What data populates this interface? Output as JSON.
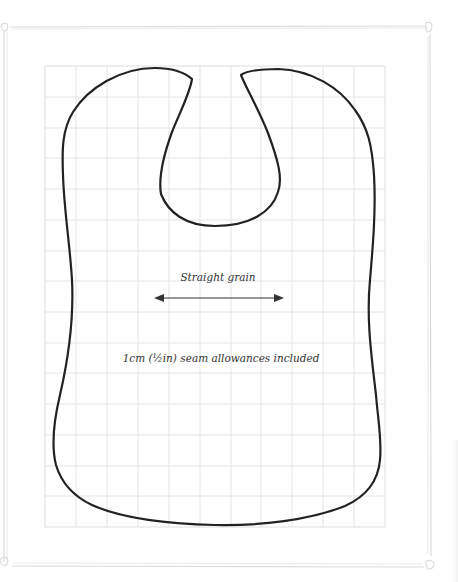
{
  "pattern": {
    "name": "Bib pattern",
    "grain_label": "Straight grain",
    "seam_label": "1cm (½in) seam allowances included",
    "grid": {
      "x0": 45,
      "y0": 66,
      "x1": 385,
      "y1": 527,
      "cell_px": 30.9,
      "columns": 11,
      "rows": 15,
      "line_color": "#e6e6e6"
    },
    "outline_color": "#222222",
    "frame_color": "#dcdcdc"
  }
}
